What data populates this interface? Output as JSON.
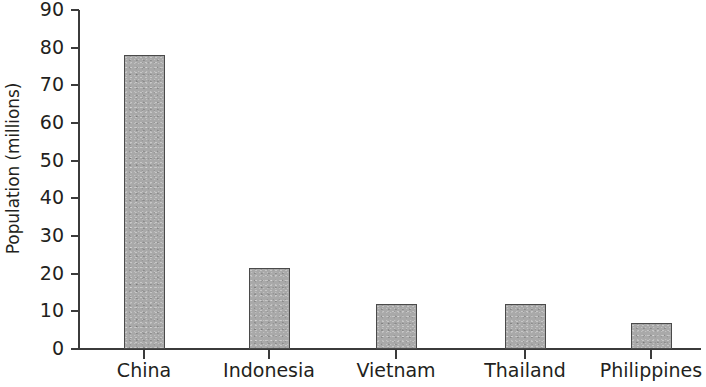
{
  "chart_data": {
    "type": "bar",
    "title": "",
    "subtitle": "",
    "xlabel": "",
    "ylabel": "Population (millions)",
    "categories": [
      "China",
      "Indonesia",
      "Vietnam",
      "Thailand",
      "Philippines"
    ],
    "values": [
      78,
      21.5,
      12,
      12,
      7
    ],
    "series": [
      {
        "name": "Population",
        "values": [
          78,
          21.5,
          12,
          12,
          7
        ]
      }
    ],
    "ylim": [
      0,
      90
    ],
    "ytick_labels": [
      "90",
      "80",
      "70",
      "60",
      "50",
      "40",
      "30",
      "20",
      "10",
      "0"
    ],
    "ytick_values": [
      90,
      80,
      70,
      60,
      50,
      40,
      30,
      20,
      10,
      0
    ],
    "grid": false,
    "legend": false,
    "legend_position": "none",
    "bar_color": "#a9a9a9",
    "bar_edge_color": "#4a4a4a",
    "axis_color": "#3b3b3b",
    "text_color": "#231f20",
    "background_color": "#ffffff"
  }
}
